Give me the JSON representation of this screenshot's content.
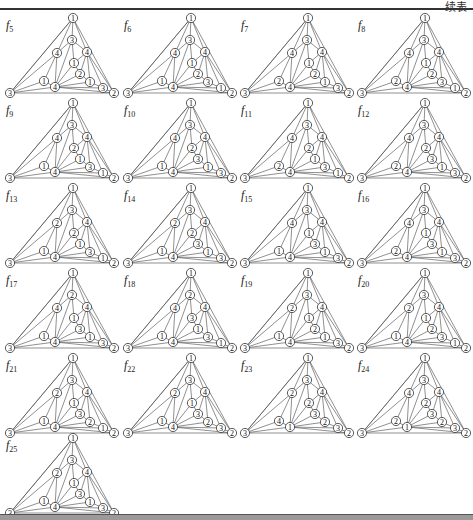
{
  "header": {
    "continued_label": "续表"
  },
  "node_order": [
    "top",
    "bottom_left",
    "bottom_right",
    "A",
    "L",
    "R",
    "C1",
    "C2",
    "P1",
    "P2",
    "LL",
    "H"
  ],
  "panels": [
    {
      "name": "f",
      "sub": "5",
      "labels": [
        "1",
        "3",
        "2",
        "3",
        "4",
        "4",
        "1",
        "2",
        "1",
        "3",
        "1",
        "4"
      ]
    },
    {
      "name": "f",
      "sub": "6",
      "labels": [
        "1",
        "3",
        "2",
        "3",
        "4",
        "4",
        "1",
        "2",
        "3",
        "1",
        "1",
        "4"
      ]
    },
    {
      "name": "f",
      "sub": "7",
      "labels": [
        "1",
        "3",
        "2",
        "3",
        "4",
        "4",
        "1",
        "2",
        "1",
        "3",
        "2",
        "4"
      ]
    },
    {
      "name": "f",
      "sub": "8",
      "labels": [
        "1",
        "3",
        "2",
        "3",
        "4",
        "4",
        "1",
        "2",
        "3",
        "1",
        "2",
        "4"
      ]
    },
    {
      "name": "f",
      "sub": "9",
      "labels": [
        "1",
        "3",
        "2",
        "3",
        "4",
        "4",
        "2",
        "1",
        "3",
        "1",
        "1",
        "4"
      ]
    },
    {
      "name": "f",
      "sub": "10",
      "labels": [
        "1",
        "3",
        "2",
        "3",
        "4",
        "4",
        "2",
        "3",
        "1",
        "3",
        "1",
        "4"
      ]
    },
    {
      "name": "f",
      "sub": "11",
      "labels": [
        "1",
        "3",
        "2",
        "3",
        "4",
        "4",
        "2",
        "1",
        "3",
        "1",
        "2",
        "4"
      ]
    },
    {
      "name": "f",
      "sub": "12",
      "labels": [
        "1",
        "3",
        "2",
        "3",
        "4",
        "4",
        "2",
        "3",
        "1",
        "3",
        "2",
        "4"
      ]
    },
    {
      "name": "f",
      "sub": "13",
      "labels": [
        "1",
        "3",
        "2",
        "3",
        "2",
        "4",
        "2",
        "1",
        "3",
        "1",
        "1",
        "4"
      ]
    },
    {
      "name": "f",
      "sub": "14",
      "labels": [
        "1",
        "3",
        "2",
        "3",
        "2",
        "4",
        "2",
        "3",
        "1",
        "3",
        "1",
        "4"
      ]
    },
    {
      "name": "f",
      "sub": "15",
      "labels": [
        "1",
        "3",
        "2",
        "3",
        "4",
        "4",
        "1",
        "3",
        "1",
        "3",
        "1",
        "4"
      ]
    },
    {
      "name": "f",
      "sub": "16",
      "labels": [
        "1",
        "3",
        "2",
        "3",
        "4",
        "4",
        "1",
        "3",
        "1",
        "3",
        "2",
        "4"
      ]
    },
    {
      "name": "f",
      "sub": "17",
      "labels": [
        "1",
        "3",
        "2",
        "2",
        "4",
        "4",
        "1",
        "3",
        "1",
        "3",
        "1",
        "4"
      ]
    },
    {
      "name": "f",
      "sub": "18",
      "labels": [
        "1",
        "3",
        "2",
        "2",
        "4",
        "4",
        "3",
        "1",
        "3",
        "1",
        "1",
        "4"
      ]
    },
    {
      "name": "f",
      "sub": "19",
      "labels": [
        "1",
        "3",
        "2",
        "3",
        "2",
        "4",
        "1",
        "2",
        "1",
        "3",
        "1",
        "4"
      ]
    },
    {
      "name": "f",
      "sub": "20",
      "labels": [
        "1",
        "3",
        "2",
        "3",
        "2",
        "4",
        "1",
        "2",
        "3",
        "1",
        "1",
        "4"
      ]
    },
    {
      "name": "f",
      "sub": "21",
      "labels": [
        "1",
        "3",
        "2",
        "3",
        "2",
        "4",
        "1",
        "3",
        "2",
        "1",
        "1",
        "4"
      ]
    },
    {
      "name": "f",
      "sub": "22",
      "labels": [
        "1",
        "3",
        "2",
        "3",
        "2",
        "4",
        "1",
        "3",
        "2",
        "3",
        "1",
        "4"
      ]
    },
    {
      "name": "f",
      "sub": "23",
      "labels": [
        "1",
        "3",
        "2",
        "3",
        "2",
        "4",
        "2",
        "3",
        "2",
        "3",
        "4",
        "1"
      ]
    },
    {
      "name": "f",
      "sub": "24",
      "labels": [
        "1",
        "3",
        "2",
        "3",
        "4",
        "4",
        "2",
        "3",
        "2",
        "3",
        "2",
        "1"
      ]
    },
    {
      "name": "f",
      "sub": "25",
      "labels": [
        "1",
        "3",
        "2",
        "3",
        "2",
        "4",
        "1",
        "3",
        "1",
        "3",
        "1",
        "4"
      ]
    }
  ],
  "layout": {
    "columns": [
      0,
      118,
      235,
      352
    ],
    "rows": [
      12,
      97,
      182,
      267,
      352,
      432
    ]
  }
}
